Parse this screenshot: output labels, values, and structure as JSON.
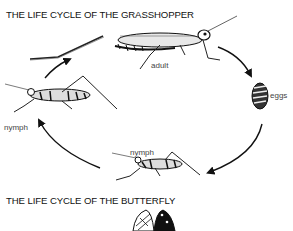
{
  "diagram": {
    "grasshopper": {
      "title": "THE LIFE CYCLE OF THE GRASSHOPPER",
      "stages": [
        {
          "name": "adult",
          "label": "adult"
        },
        {
          "name": "eggs",
          "label": "eggs"
        },
        {
          "name": "nymph-bottom",
          "label": "nymph"
        },
        {
          "name": "nymph-left",
          "label": "nymph"
        }
      ],
      "cycle_direction": "clockwise",
      "arrow_color": "#111111"
    },
    "butterfly": {
      "title": "THE LIFE CYCLE OF THE BUTTERFLY"
    }
  }
}
